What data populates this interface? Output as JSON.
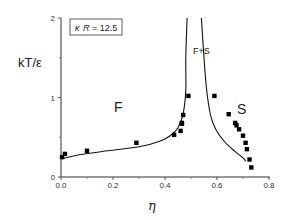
{
  "chart_data": {
    "type": "scatter",
    "title": "",
    "xlabel": "η",
    "ylabel": "kT/ε",
    "xlim": [
      0,
      0.8
    ],
    "ylim": [
      0,
      2
    ],
    "x_ticks": [
      {
        "value": 0.0,
        "label": "0.0"
      },
      {
        "value": 0.2,
        "label": "0.2"
      },
      {
        "value": 0.4,
        "label": "0.4"
      },
      {
        "value": 0.6,
        "label": "0.6"
      },
      {
        "value": 0.8,
        "label": "0.8"
      }
    ],
    "x_minor_ticks": [
      0.1,
      0.3,
      0.5,
      0.7
    ],
    "y_ticks": [
      {
        "value": 0,
        "label": "0"
      },
      {
        "value": 1,
        "label": "1"
      },
      {
        "value": 2,
        "label": "2"
      }
    ],
    "y_minor_ticks": [
      0.5,
      1.5
    ],
    "grid": false,
    "annotation": {
      "text": "κR = 12.5",
      "kappa": "κ",
      "R": "R",
      "rest": " = 12.5"
    },
    "region_labels": [
      {
        "text": "F",
        "x": 0.22,
        "y": 0.82
      },
      {
        "text": "F+S",
        "x": 0.54,
        "y": 1.55
      },
      {
        "text": "S",
        "x": 0.695,
        "y": 0.79
      }
    ],
    "series": [
      {
        "name": "simulation points",
        "style": "square-markers",
        "points": [
          [
            0.004,
            0.25
          ],
          [
            0.015,
            0.29
          ],
          [
            0.1,
            0.33
          ],
          [
            0.29,
            0.43
          ],
          [
            0.435,
            0.53
          ],
          [
            0.46,
            0.58
          ],
          [
            0.465,
            0.67
          ],
          [
            0.465,
            0.68
          ],
          [
            0.47,
            0.78
          ],
          [
            0.49,
            1.02
          ],
          [
            0.59,
            1.02
          ],
          [
            0.645,
            0.79
          ],
          [
            0.67,
            0.68
          ],
          [
            0.675,
            0.65
          ],
          [
            0.685,
            0.6
          ],
          [
            0.7,
            0.52
          ],
          [
            0.71,
            0.43
          ],
          [
            0.715,
            0.35
          ],
          [
            0.725,
            0.22
          ],
          [
            0.732,
            0.12
          ]
        ]
      },
      {
        "name": "fluid coexistence boundary",
        "style": "line",
        "points": [
          [
            0.004,
            0.23
          ],
          [
            0.07,
            0.28
          ],
          [
            0.18,
            0.33
          ],
          [
            0.3,
            0.38
          ],
          [
            0.38,
            0.45
          ],
          [
            0.42,
            0.52
          ],
          [
            0.45,
            0.62
          ],
          [
            0.47,
            0.8
          ],
          [
            0.48,
            1.1
          ],
          [
            0.48,
            1.5
          ],
          [
            0.485,
            2.0
          ]
        ]
      },
      {
        "name": "solid coexistence boundary",
        "style": "line",
        "points": [
          [
            0.54,
            2.0
          ],
          [
            0.55,
            1.5
          ],
          [
            0.56,
            1.1
          ],
          [
            0.575,
            0.78
          ],
          [
            0.595,
            0.6
          ],
          [
            0.63,
            0.44
          ],
          [
            0.67,
            0.32
          ],
          [
            0.7,
            0.24
          ],
          [
            0.71,
            0.2
          ]
        ]
      }
    ]
  }
}
